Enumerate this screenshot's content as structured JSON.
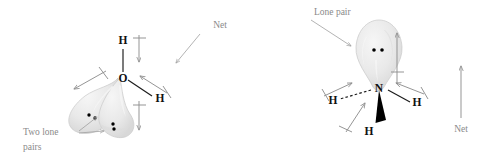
{
  "figure": {
    "background_color": "#ffffff",
    "width": 486,
    "height": 165
  },
  "colors": {
    "atom_text": "#111111",
    "bond": "#1a1a1a",
    "dipole_arrow": "#8f8f8f",
    "annotation_text": "#8a8a8a",
    "leader_line": "#a0a0a0",
    "lobe_fill": "#e9e9e9",
    "lobe_stroke": "#c9c9c9",
    "electron_dot": "#000000"
  },
  "water": {
    "name": "water-molecule",
    "central_atom": "O",
    "hydrogen_top": "H",
    "hydrogen_right": "H",
    "lone_pair_label": "Two lone",
    "lone_pair_label_line2": "pairs",
    "net_label": "Net",
    "lone_pair_count": 2,
    "electron_dots": 4,
    "bonds": [
      {
        "to": "H",
        "style": "plain",
        "direction": "up"
      },
      {
        "to": "H",
        "style": "plain",
        "direction": "down-right"
      }
    ],
    "bond_dipoles": [
      {
        "label": "O-H top bond dipole",
        "direction": "down"
      },
      {
        "label": "O-H right bond dipole",
        "direction": "up-left"
      }
    ],
    "lone_pair_dipoles": [
      {
        "label": "lone pair dipole left",
        "direction": "down-left"
      },
      {
        "label": "lone pair dipole lower",
        "direction": "down"
      }
    ],
    "net_dipole_direction": "down-left"
  },
  "ammonia": {
    "name": "ammonia-molecule",
    "central_atom": "N",
    "hydrogen_left": "H",
    "hydrogen_right": "H",
    "hydrogen_front": "H",
    "lone_pair_label": "Lone pair",
    "net_label": "Net",
    "lone_pair_count": 1,
    "electron_dots": 2,
    "bonds": [
      {
        "to": "H",
        "style": "dashed",
        "direction": "left"
      },
      {
        "to": "H",
        "style": "plain",
        "direction": "right"
      },
      {
        "to": "H",
        "style": "wedge",
        "direction": "down-front"
      }
    ],
    "bond_dipoles": [
      {
        "label": "N-H left bond dipole",
        "direction": "up-right"
      },
      {
        "label": "N-H right bond dipole",
        "direction": "up-left"
      },
      {
        "label": "N-H front bond dipole",
        "direction": "up-right"
      }
    ],
    "lone_pair_dipoles": [
      {
        "label": "lone pair dipole",
        "direction": "up"
      }
    ],
    "net_dipole_direction": "up"
  }
}
